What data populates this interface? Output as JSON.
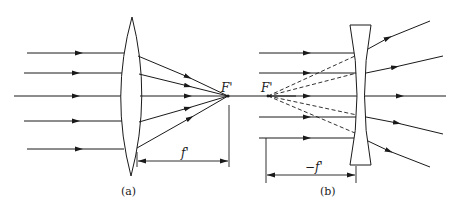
{
  "figure": {
    "panel_a": {
      "label": "(a)",
      "lens_type": "convex (converging)",
      "focal_label": "F'",
      "focal_length_label": "f'",
      "incoming_ray_ys": [
        53,
        73,
        96,
        121,
        149
      ],
      "focal_point": [
        228,
        96
      ]
    },
    "panel_b": {
      "label": "(b)",
      "lens_type": "concave (diverging)",
      "focal_label": "F'",
      "focal_length_label": "−f'",
      "incoming_ray_ys": [
        53,
        73,
        96,
        117,
        138
      ],
      "virtual_focal_point": [
        268,
        96
      ]
    },
    "caption": ""
  },
  "colors": {
    "line": "#1a1a1a",
    "background": "#ffffff"
  }
}
